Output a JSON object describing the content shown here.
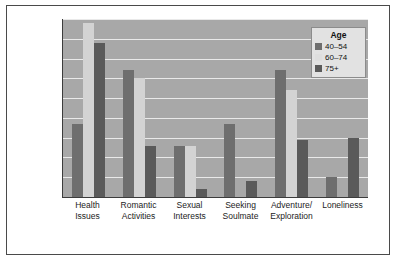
{
  "chart_data": {
    "type": "bar",
    "title": "",
    "xlabel": "",
    "ylabel": "Percentage Mentioning Theme",
    "ylim": [
      0,
      45
    ],
    "ytick_step": 5,
    "yticks": [
      0,
      5,
      10,
      15,
      20,
      25,
      30,
      35,
      40,
      45
    ],
    "grid": true,
    "grid_axis": "y",
    "legend_position": "top-right",
    "legend_title": "Age",
    "categories": [
      "Health Issues",
      "Romantic Activities",
      "Sexual Interests",
      "Seeking Soulmate",
      "Adventure/ Exploration",
      "Loneliness"
    ],
    "category_lines": [
      [
        "Health",
        "Issues"
      ],
      [
        "Romantic",
        "Activities"
      ],
      [
        "Sexual",
        "Interests"
      ],
      [
        "Seeking",
        "Soulmate"
      ],
      [
        "Adventure/",
        "Exploration"
      ],
      [
        "Loneliness",
        ""
      ]
    ],
    "series": [
      {
        "name": "40–54",
        "color": "#6e6e6e",
        "values": [
          18.5,
          32,
          13,
          18.5,
          32,
          5
        ]
      },
      {
        "name": "60–74",
        "color": "#d3d3d3",
        "values": [
          44,
          30,
          13,
          0,
          27,
          0
        ]
      },
      {
        "name": "75+",
        "color": "#5a5a5a",
        "values": [
          39,
          13,
          2,
          4,
          14.5,
          15
        ]
      }
    ]
  },
  "legend": {
    "title": "Age",
    "entries": [
      {
        "label": "40–54"
      },
      {
        "label": "60–74"
      },
      {
        "label": "75+"
      }
    ]
  },
  "axes": {
    "y_title": "Percentage Mentioning Theme"
  }
}
